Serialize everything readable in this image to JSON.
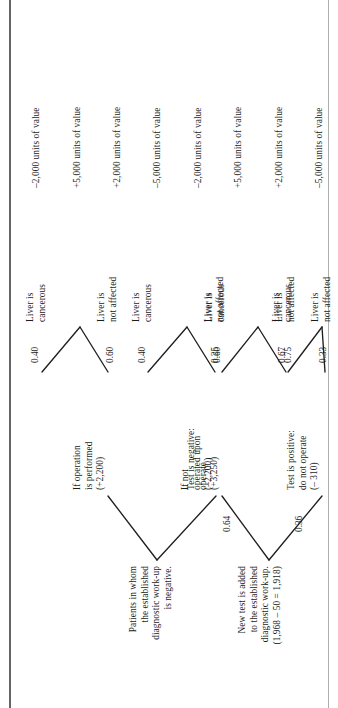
{
  "figure": {
    "kind": "decision-tree",
    "orientation": "rotated-90-ccw",
    "rule_color": "#4a4a4a",
    "line_color": "#1f1f1f"
  },
  "trees": [
    {
      "id": "tree-without-test",
      "root": "Patients in whom\nthe established\ndiagnostic work-up\nis negative.",
      "branches": [
        {
          "id": "branch-operate",
          "label": "If operation\nis performed\n(+2,200)",
          "outcomes": [
            {
              "prob": "0.40",
              "state": "Liver is\ncancerous",
              "value": "–2,000 units of value"
            },
            {
              "prob": "0.60",
              "state": "Liver is\nnot affected",
              "value": "+5,000 units of value"
            }
          ]
        },
        {
          "id": "branch-not-operate",
          "label": "If not\noperated upon\n(–2,200)",
          "outcomes": [
            {
              "prob": "0.40",
              "state": "Liver is\ncancerous",
              "value": "+2,000 units of value"
            },
            {
              "prob": "0.60",
              "state": "Liver is\nnot affected",
              "value": "–5,000 units of value"
            }
          ]
        }
      ]
    },
    {
      "id": "tree-with-new-test",
      "root": "New test is added\nto the established\ndiagnostic work-up.\n(1,968 – 50 = 1,918)",
      "branches": [
        {
          "id": "branch-test-negative",
          "prob": "0.64",
          "label": "Test is negative:\noperate\n(+3,250)",
          "outcomes": [
            {
              "prob": "0.25",
              "state": "Liver is\ncancerous",
              "value": "–2,000 units of value"
            },
            {
              "prob": "0.75",
              "state": "Liver is\nnot affected",
              "value": "+5,000 units of value"
            }
          ]
        },
        {
          "id": "branch-test-positive",
          "prob": "0.36",
          "label": "Test is positive:\ndo not operate\n(– 310)",
          "outcomes": [
            {
              "prob": "0.67",
              "state": "Liver is\ncancerous",
              "value": "+2,000 units of value"
            },
            {
              "prob": "0.33",
              "state": "Liver is\nnot affected",
              "value": "–5,000 units of value"
            }
          ]
        }
      ]
    }
  ]
}
